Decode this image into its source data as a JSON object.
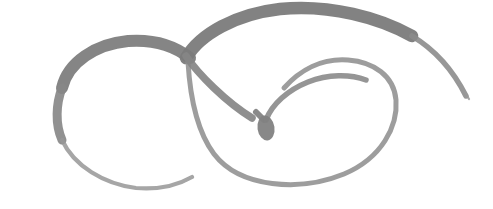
{
  "image": {
    "title": "Continuous-line spiral loop sketch",
    "subject": "abstract doodle of two interlocking loops ending in a teardrop",
    "medium": "pencil / charcoal scan",
    "width_px": 493,
    "height_px": 209,
    "background_color": "#ffffff",
    "ink_color": "#808080",
    "ink_color_dark": "#6f6f6f",
    "ink_color_light": "#9a9a9a",
    "texture": "dithered halftone grain"
  },
  "strokes": [
    {
      "name": "outer-top-arc",
      "description": "thick dark arc sweeping across the top from the crossing to the upper right",
      "path": "M 186 58 C 200 34 236 14 280 9 C 330 4 380 18 412 36",
      "width": 12.5,
      "color": "#7b7b7b",
      "opacity": 0.95
    },
    {
      "name": "upper-right-tail",
      "description": "tapering tail descending to a fine point at the right edge",
      "path": "M 412 36 C 432 48 452 68 466 96",
      "width": 5.5,
      "color": "#8c8c8c",
      "opacity": 0.9
    },
    {
      "name": "upper-right-tail-tip",
      "description": "very fine tapered terminus of the right tail",
      "path": "M 458 82 C 462 88 466 94 469 99",
      "width": 2.2,
      "color": "#999999",
      "opacity": 0.85
    },
    {
      "name": "left-loop-top",
      "description": "thick upper arc of the large left loop running into the crossing",
      "path": "M 62 88 C 68 62 96 44 128 41 C 156 39 176 47 190 58",
      "width": 12.0,
      "color": "#7e7e7e",
      "opacity": 0.95
    },
    {
      "name": "left-loop-left",
      "description": "left flank of the large left loop, thinning downward",
      "path": "M 62 88 C 56 104 55 124 62 140",
      "width": 9.0,
      "color": "#888888",
      "opacity": 0.92
    },
    {
      "name": "left-loop-bottom",
      "description": "thin lower arc of the left loop tapering to a point",
      "path": "M 62 140 C 74 166 104 184 136 188 C 160 190 178 185 192 177",
      "width": 4.2,
      "color": "#969696",
      "opacity": 0.85
    },
    {
      "name": "left-loop-bottom-tip",
      "description": "faint tapered end of the left loop's bottom arc",
      "path": "M 180 183 C 186 181 190 179 193 177",
      "width": 2.0,
      "color": "#a5a5a5",
      "opacity": 0.8
    },
    {
      "name": "crossing-descender",
      "description": "stroke descending diagonally from the crossing toward the teardrop",
      "path": "M 186 56 C 198 74 226 102 252 118",
      "width": 7.5,
      "color": "#858585",
      "opacity": 0.92
    },
    {
      "name": "right-loop-outer",
      "description": "large right loop sweeping from the crossing down around and back up",
      "path": "M 188 62 C 190 96 196 130 214 154 C 240 188 300 192 344 174 C 382 158 398 126 396 100 C 394 76 374 62 348 60 C 322 58 300 70 284 88",
      "width": 5.0,
      "color": "#909090",
      "opacity": 0.88
    },
    {
      "name": "spiral-inner-arm",
      "description": "inner spiral arm curving from the teardrop up and right",
      "path": "M 266 120 C 272 104 288 90 308 82 C 328 74 350 74 366 80",
      "width": 5.5,
      "color": "#8a8a8a",
      "opacity": 0.9
    },
    {
      "name": "teardrop-stem",
      "description": "short stem joining the descender into the teardrop blob",
      "path": "M 256 112 L 264 120",
      "width": 6.0,
      "color": "#808080",
      "opacity": 0.92
    }
  ],
  "teardrop": {
    "name": "center-teardrop-blob",
    "description": "filled oval blob terminating the spiral at the centre",
    "cx": 266,
    "cy": 128,
    "rx": 8.5,
    "ry": 12.5,
    "rotation": -8,
    "color": "#828282",
    "opacity": 0.95
  }
}
